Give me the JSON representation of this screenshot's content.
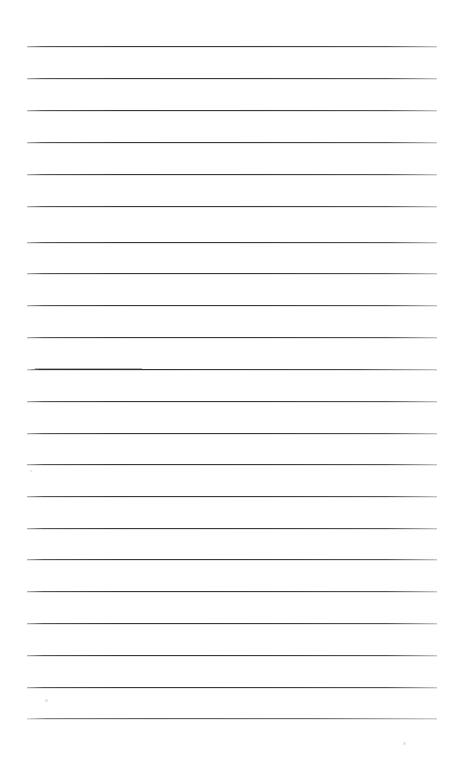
{
  "document": {
    "type": "lined-notebook-page",
    "title": "Lined notebook page",
    "orientation": "portrait",
    "page_width": 455,
    "page_height": 764,
    "background_color": "#ffffff",
    "rule_color": "#3e3e42",
    "rule_thickness_px": 1,
    "rule_left_x": 27,
    "rule_right_x": 437,
    "rule_spacing_px": 32,
    "rule_count": 22,
    "margin_rule_present": false,
    "written_content": "",
    "content_note": "blank ruled sheet — no handwriting, typed text, headings or page numbers present"
  },
  "rules": [
    {
      "index": 1,
      "y": 46,
      "weight": "normal"
    },
    {
      "index": 2,
      "y": 78,
      "weight": "normal"
    },
    {
      "index": 3,
      "y": 110,
      "weight": "normal"
    },
    {
      "index": 4,
      "y": 142,
      "weight": "normal"
    },
    {
      "index": 5,
      "y": 174,
      "weight": "normal"
    },
    {
      "index": 6,
      "y": 206,
      "weight": "normal"
    },
    {
      "index": 7,
      "y": 242,
      "weight": "normal"
    },
    {
      "index": 8,
      "y": 273,
      "weight": "normal"
    },
    {
      "index": 9,
      "y": 305,
      "weight": "normal"
    },
    {
      "index": 10,
      "y": 337,
      "weight": "normal"
    },
    {
      "index": 11,
      "y": 369,
      "weight": "heavy-left"
    },
    {
      "index": 12,
      "y": 401,
      "weight": "normal"
    },
    {
      "index": 13,
      "y": 433,
      "weight": "normal"
    },
    {
      "index": 14,
      "y": 464,
      "weight": "normal"
    },
    {
      "index": 15,
      "y": 496,
      "weight": "normal"
    },
    {
      "index": 16,
      "y": 528,
      "weight": "normal"
    },
    {
      "index": 17,
      "y": 559,
      "weight": "normal"
    },
    {
      "index": 18,
      "y": 591,
      "weight": "normal"
    },
    {
      "index": 19,
      "y": 623,
      "weight": "normal"
    },
    {
      "index": 20,
      "y": 655,
      "weight": "normal"
    },
    {
      "index": 21,
      "y": 687,
      "weight": "normal"
    },
    {
      "index": 22,
      "y": 718,
      "weight": "light"
    }
  ],
  "scan_artifacts": [
    {
      "x": 45,
      "y": 699,
      "size": 3
    },
    {
      "x": 403,
      "y": 742,
      "size": 3
    },
    {
      "x": 30,
      "y": 470,
      "size": 2
    }
  ]
}
